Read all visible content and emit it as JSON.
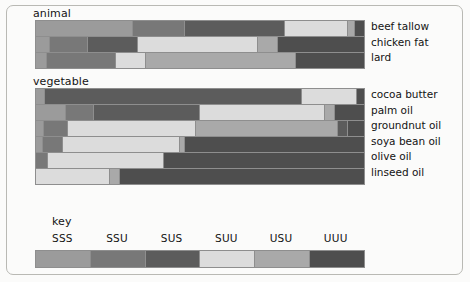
{
  "figure": {
    "sections": {
      "animal_title": "animal",
      "vegetable_title": "vegetable",
      "key_title": "key"
    }
  },
  "key": {
    "categories": [
      "SSS",
      "SSU",
      "SUS",
      "SUU",
      "USU",
      "UUU"
    ],
    "colors": [
      "#9b9b9b",
      "#787878",
      "#5c5c5c",
      "#dcdcdc",
      "#a9a9a9",
      "#4e4e4e"
    ]
  },
  "chart_data": {
    "type": "bar",
    "xlabel": "",
    "ylabel": "",
    "ylim": [
      0,
      100
    ],
    "grid": false,
    "legend_position": "bottom",
    "stacked": true,
    "orientation": "horizontal",
    "categories": [
      "SSS",
      "SSU",
      "SUS",
      "SUU",
      "USU",
      "UUU"
    ],
    "category_colors": [
      "#9b9b9b",
      "#787878",
      "#5c5c5c",
      "#dcdcdc",
      "#a9a9a9",
      "#4e4e4e"
    ],
    "groups": [
      {
        "name": "animal",
        "bars": [
          {
            "label": "beef tallow",
            "segments": [
              {
                "category": "SSS",
                "value": 29.6
              },
              {
                "category": "SSU",
                "value": 15.9
              },
              {
                "category": "SUS",
                "value": 30.5
              },
              {
                "category": "SUU",
                "value": 19.2
              },
              {
                "category": "USU",
                "value": 2.1
              },
              {
                "category": "UUU",
                "value": 2.7
              }
            ]
          },
          {
            "label": "chicken fat",
            "segments": [
              {
                "category": "SSS",
                "value": 4.3
              },
              {
                "category": "SSU",
                "value": 11.6
              },
              {
                "category": "SUS",
                "value": 15.2
              },
              {
                "category": "SUU",
                "value": 36.6
              },
              {
                "category": "USU",
                "value": 6.1
              },
              {
                "category": "UUU",
                "value": 26.2
              }
            ]
          },
          {
            "label": "lard",
            "segments": [
              {
                "category": "SSS",
                "value": 3.4
              },
              {
                "category": "SSU",
                "value": 21.0
              },
              {
                "category": "SUU",
                "value": 9.2
              },
              {
                "category": "USU",
                "value": 45.7
              },
              {
                "category": "UUU",
                "value": 20.7
              }
            ]
          }
        ]
      },
      {
        "name": "vegetable",
        "bars": [
          {
            "label": "cocoa butter",
            "segments": [
              {
                "category": "SSS",
                "value": 2.8
              },
              {
                "category": "SUS",
                "value": 78.3
              },
              {
                "category": "SUU",
                "value": 16.8
              },
              {
                "category": "UUU",
                "value": 2.1
              }
            ]
          },
          {
            "label": "palm oil",
            "segments": [
              {
                "category": "SSS",
                "value": 9.1
              },
              {
                "category": "SSU",
                "value": 8.6
              },
              {
                "category": "SUS",
                "value": 32.3
              },
              {
                "category": "SUU",
                "value": 38.1
              },
              {
                "category": "USU",
                "value": 3.1
              },
              {
                "category": "UUU",
                "value": 8.8
              }
            ]
          },
          {
            "label": "groundnut oil",
            "segments": [
              {
                "category": "SSS",
                "value": 2.4
              },
              {
                "category": "SSU",
                "value": 7.3
              },
              {
                "category": "SUU",
                "value": 39.1
              },
              {
                "category": "USU",
                "value": 43.3
              },
              {
                "category": "SUS",
                "value": 3.1
              },
              {
                "category": "UUU",
                "value": 4.8
              }
            ]
          },
          {
            "label": "soya bean oil",
            "segments": [
              {
                "category": "SSS",
                "value": 2.1
              },
              {
                "category": "SSU",
                "value": 6.1
              },
              {
                "category": "SUU",
                "value": 35.7
              },
              {
                "category": "USU",
                "value": 1.5
              },
              {
                "category": "UUU",
                "value": 54.6
              }
            ]
          },
          {
            "label": "olive oil",
            "segments": [
              {
                "category": "SSU",
                "value": 3.7
              },
              {
                "category": "SUU",
                "value": 35.4
              },
              {
                "category": "UUU",
                "value": 60.9
              }
            ]
          },
          {
            "label": "linseed oil",
            "segments": [
              {
                "category": "SUU",
                "value": 22.6
              },
              {
                "category": "USU",
                "value": 3.0
              },
              {
                "category": "UUU",
                "value": 74.4
              }
            ]
          }
        ]
      }
    ]
  }
}
